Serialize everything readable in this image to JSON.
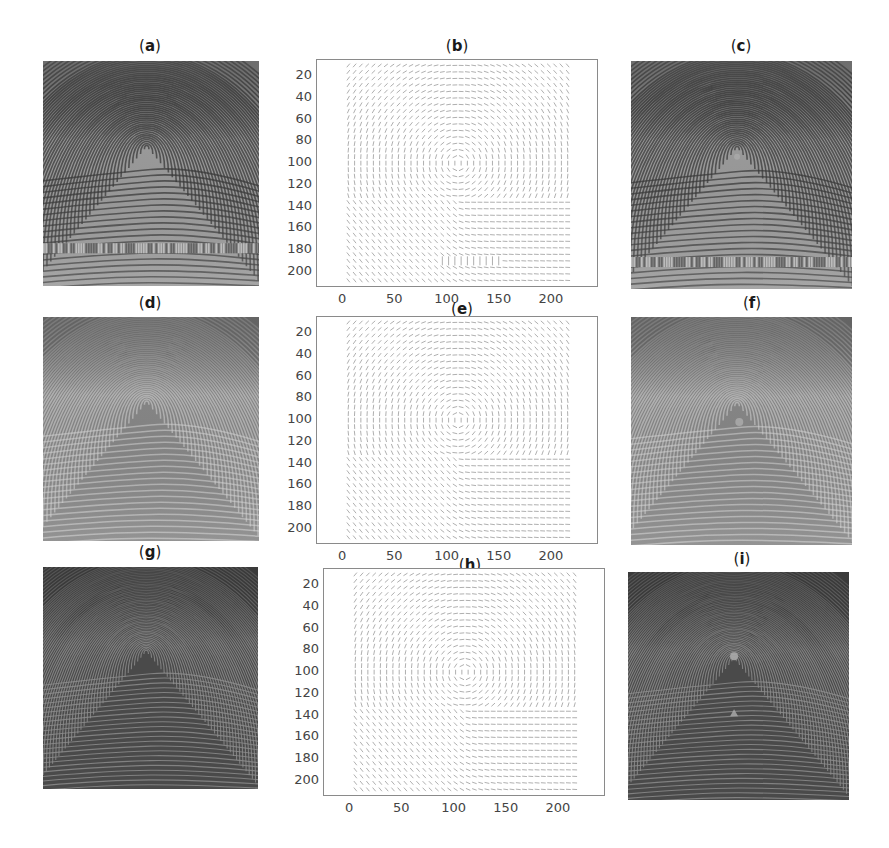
{
  "figure": {
    "panels": [
      {
        "id": "a",
        "label_open": "(",
        "letter": "a",
        "label_close": ")",
        "type": "image",
        "description": "original fingerprint with horizontal noisy band near bottom",
        "style": "light"
      },
      {
        "id": "b",
        "label_open": "(",
        "letter": "b",
        "label_close": ")",
        "type": "quiver",
        "description": "orientation field of (a)"
      },
      {
        "id": "c",
        "label_open": "(",
        "letter": "c",
        "label_close": ")",
        "type": "image",
        "description": "fingerprint with detected core point",
        "style": "light"
      },
      {
        "id": "d",
        "label_open": "(",
        "letter": "d",
        "label_close": ")",
        "type": "image",
        "description": "fingerprint, noisy band removed",
        "style": "mid"
      },
      {
        "id": "e",
        "label_open": "(",
        "letter": "e",
        "label_close": ")",
        "type": "quiver",
        "description": "orientation field of (d)"
      },
      {
        "id": "f",
        "label_open": "(",
        "letter": "f",
        "label_close": ")",
        "type": "image",
        "description": "fingerprint with detected core point",
        "style": "mid"
      },
      {
        "id": "g",
        "label_open": "(",
        "letter": "g",
        "label_close": ")",
        "type": "image",
        "description": "synthetic dark fingerprint",
        "style": "dark"
      },
      {
        "id": "h",
        "label_open": "(",
        "letter": "h",
        "label_close": ")",
        "type": "quiver",
        "description": "orientation field of (g)"
      },
      {
        "id": "i",
        "label_open": "(",
        "letter": "i",
        "label_close": ")",
        "type": "image",
        "description": "synthetic fingerprint with core and delta points marked",
        "style": "dark"
      }
    ],
    "axes": {
      "yticks": [
        "20",
        "40",
        "60",
        "80",
        "100",
        "120",
        "140",
        "160",
        "180",
        "200"
      ],
      "xticks": [
        "0",
        "50",
        "100",
        "150",
        "200"
      ],
      "x_range": [
        -25,
        245
      ],
      "y_range": [
        5,
        215
      ]
    }
  },
  "chart_data": [
    {
      "type": "quiver",
      "title": "(b)",
      "xticks": [
        0,
        50,
        100,
        150,
        200
      ],
      "yticks": [
        20,
        40,
        60,
        80,
        100,
        120,
        140,
        160,
        180,
        200
      ],
      "xlim": [
        -25,
        245
      ],
      "ylim": [
        215,
        5
      ],
      "note": "orientation field; disturbed vectors near y≈190, x≈100–150"
    },
    {
      "type": "quiver",
      "title": "(e)",
      "xticks": [
        0,
        50,
        100,
        150,
        200
      ],
      "yticks": [
        20,
        40,
        60,
        80,
        100,
        120,
        140,
        160,
        180,
        200
      ],
      "xlim": [
        -25,
        245
      ],
      "ylim": [
        215,
        5
      ]
    },
    {
      "type": "quiver",
      "title": "(h)",
      "xticks": [
        0,
        50,
        100,
        150,
        200
      ],
      "yticks": [
        20,
        40,
        60,
        80,
        100,
        120,
        140,
        160,
        180,
        200
      ],
      "xlim": [
        -25,
        245
      ],
      "ylim": [
        215,
        5
      ]
    }
  ],
  "colors": {
    "light_bg": "#9a9a9a",
    "mid_bg": "#858585",
    "dark_bg": "#4a4a4a",
    "ridge_light": "#3a3a3a",
    "ridge_dark": "#8e8e8e",
    "marker": "#a8a8a8",
    "axis": "#8a8a8a",
    "arrow": "#9a9a9a"
  }
}
